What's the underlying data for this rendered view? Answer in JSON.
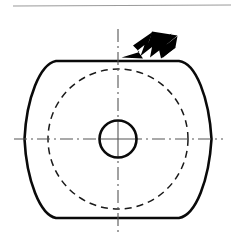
{
  "figure": {
    "kind": "engineering-orthographic-view",
    "canvas": {
      "width": 236,
      "height": 246
    },
    "background_color": "#ffffff"
  },
  "colors": {
    "ink": "#000000",
    "outline": "#0a0a0a",
    "hidden_line": "#1a1a1a",
    "centre_line": "#555555",
    "header_rule": "#9a9a9a",
    "arrow_fill": "#000000",
    "paper": "#ffffff"
  },
  "header_rule": {
    "label": "header-rule",
    "x1": 13,
    "y1": 6,
    "x2": 231,
    "y2": 5,
    "stroke_width": 1.1
  },
  "part_outline": {
    "label": "part-outline",
    "line_type": "continuous-thick-visible",
    "stroke_width": 2.6,
    "flat_top_y": 61,
    "flat_bottom_y": 218,
    "flat_left_x": 56,
    "flat_right_x": 179,
    "left_apex_x": 25,
    "right_apex_x": 212,
    "centre_y": 139,
    "path": "M 56 61 L 179 61 C 196 63 209 98 211.5 139 C 209 180 196 215 179 218 L 56 218 C 40 215 26.5 180 24.5 139 C 26.5 98 40 64 56 61 Z"
  },
  "hidden_circle": {
    "label": "hidden-circle",
    "line_type": "dashed-hidden",
    "cx": 118,
    "cy": 139,
    "r": 70,
    "stroke_width": 1.5,
    "dash_pattern": "7 5"
  },
  "bore_circle": {
    "label": "centre-bore",
    "line_type": "continuous-thick-visible",
    "cx": 118,
    "cy": 139,
    "r": 18.5,
    "stroke_width": 2.6
  },
  "centre_lines": {
    "line_type": "long-dash-dot-chain",
    "stroke_width": 1.1,
    "dash_pattern": "13 4 2 4",
    "horizontal": {
      "label": "horizontal-centre-line",
      "x1": 14,
      "y1": 139,
      "x2": 223,
      "y2": 139
    },
    "vertical": {
      "label": "vertical-centre-line",
      "x1": 118,
      "y1": 29,
      "x2": 118,
      "y2": 236
    }
  },
  "view_arrow": {
    "label": "view-direction-arrow",
    "style": "solid-filled-fletched-dart",
    "direction": "down-left",
    "tip": {
      "x": 121,
      "y": 57
    },
    "tail": {
      "x": 176,
      "y": 15
    },
    "fill": "#000000",
    "path": "M 121.5 57.5 L 139.5 52.0 L 133.0 45.5 L 152.5 32.0 L 148.5 42.5 L 160.0 33.5 L 158.5 44.0 L 171.5 33.5 L 166.5 44.5 L 177.5 36.0 L 175.5 47.0 L 162.5 58.0 L 163.0 47.5 L 150.0 57.5 L 152.0 47.0 L 140.5 56.0 L 144.5 45.0 L 137.5 50.5 L 143.0 58.5 L 121.5 57.5 Z",
    "fletch_path": "M 152.0 31.5 L 177.5 35.5 L 166.0 45.0 L 176.0 47.5 L 161.0 58.5 L 158.5 47.5 L 148.5 43.0 Z"
  }
}
